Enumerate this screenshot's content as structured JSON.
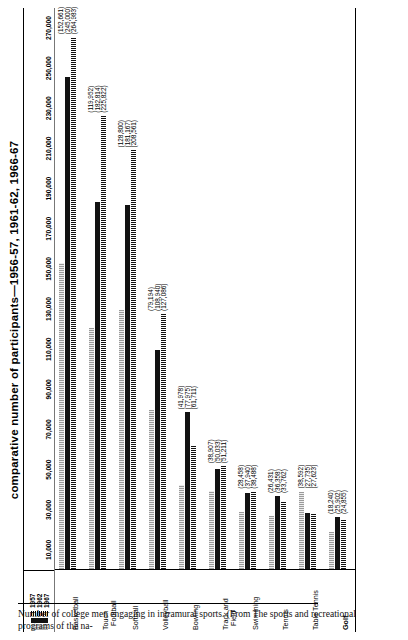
{
  "chart_data": {
    "type": "bar",
    "orientation": "horizontal",
    "title": "comparative number of participants—1956-57, 1961-62, 1966-67",
    "xlabel": "",
    "ylabel": "",
    "xlim": [
      0,
      280000
    ],
    "grid": false,
    "legend_position": "top-left",
    "ticks": [
      "10,000",
      "30,000",
      "50,000",
      "70,000",
      "90,000",
      "110,000",
      "130,000",
      "150,000",
      "170,000",
      "190,000",
      "210,000",
      "230,000",
      "250,000",
      "270,000"
    ],
    "tick_values": [
      10000,
      30000,
      50000,
      70000,
      90000,
      110000,
      130000,
      150000,
      170000,
      190000,
      210000,
      230000,
      250000,
      270000
    ],
    "legend": [
      "1957",
      "1962",
      "1967"
    ],
    "categories": [
      "Basketball",
      "Touch Football",
      "Softball",
      "Volleyball",
      "Bowling",
      "Track and Field",
      "Swimming",
      "Tennis",
      "Table Tennis",
      "Golf"
    ],
    "series": [
      {
        "name": "1957",
        "values": [
          152661,
          119952,
          128800,
          79194,
          41978,
          38907,
          28458,
          26431,
          38592,
          18240
        ]
      },
      {
        "name": "1962",
        "values": [
          245000,
          182814,
          181167,
          108940,
          77975,
          50033,
          37940,
          36358,
          27735,
          25902
        ]
      },
      {
        "name": "1967",
        "values": [
          264983,
          225822,
          208561,
          127086,
          61711,
          51211,
          38488,
          33762,
          27623,
          24855
        ]
      }
    ],
    "value_labels": [
      [
        "(152,661)",
        "(245,000)",
        "(264,983)"
      ],
      [
        "(119,952)",
        "(182,814)",
        "(225,822)"
      ],
      [
        "(128,800)",
        "(181,167)",
        "(208,561)"
      ],
      [
        "(79,194)",
        "(108,940)",
        "(127,086)"
      ],
      [
        "(41,978)",
        "(77,975)",
        "(61,711)"
      ],
      [
        "(38,907)",
        "(50,033)",
        "(51,211)"
      ],
      [
        "(28,458)",
        "(37,940)",
        "(38,488)"
      ],
      [
        "(26,431)",
        "(36,358)",
        "(33,762)"
      ],
      [
        "(38,592)",
        "(27,735)",
        "(27,623)"
      ],
      [
        "(18,240)",
        "(25,902)",
        "(24,855)"
      ]
    ]
  },
  "caption": {
    "text": "Number of college men engaging in intramural sports. (From The sports and recreational programs of the na-"
  },
  "colors": {
    "series_1957": "#9a9a9a",
    "series_1962": "#121212",
    "series_1967": "#111111",
    "background": "#ffffff",
    "text": "#000000"
  }
}
